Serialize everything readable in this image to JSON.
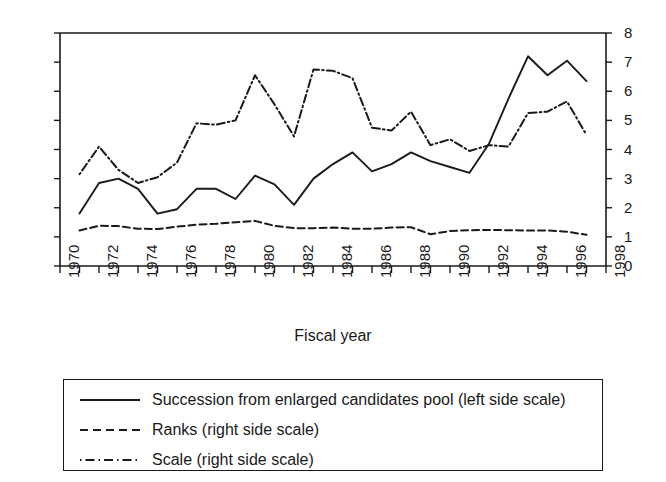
{
  "chart_data": {
    "type": "line",
    "title": "",
    "xlabel": "Fiscal year",
    "ylabel": "",
    "xlim": [
      1970,
      1998
    ],
    "xticks": [
      1970,
      1971,
      1972,
      1973,
      1974,
      1975,
      1976,
      1977,
      1978,
      1979,
      1980,
      1981,
      1982,
      1983,
      1984,
      1985,
      1986,
      1987,
      1988,
      1989,
      1990,
      1991,
      1992,
      1993,
      1994,
      1995,
      1996,
      1997,
      1998
    ],
    "xtick_labels": [
      "1970",
      "1972",
      "1974",
      "1976",
      "1978",
      "1980",
      "1982",
      "1984",
      "1986",
      "1988",
      "1990",
      "1992",
      "1994",
      "1996",
      "1998"
    ],
    "xtick_label_years": [
      1970,
      1972,
      1974,
      1976,
      1978,
      1980,
      1982,
      1984,
      1986,
      1988,
      1990,
      1992,
      1994,
      1996,
      1998
    ],
    "left_axis": {
      "label": "",
      "ylim": [
        0,
        16
      ],
      "ticks": [
        0,
        2,
        4,
        6,
        8,
        10,
        12,
        14,
        16
      ],
      "grid": false
    },
    "right_axis": {
      "label": "",
      "ylim": [
        0,
        8
      ],
      "ticks": [
        0,
        1,
        2,
        3,
        4,
        5,
        6,
        7,
        8
      ],
      "grid": false
    },
    "legend_position": "below-plot",
    "x": [
      1971,
      1972,
      1973,
      1974,
      1975,
      1976,
      1977,
      1978,
      1979,
      1980,
      1981,
      1982,
      1983,
      1984,
      1985,
      1986,
      1987,
      1988,
      1989,
      1990,
      1991,
      1992,
      1993,
      1994,
      1995,
      1996,
      1997
    ],
    "series": [
      {
        "name": "Succession from enlarged candidates pool (left side scale)",
        "axis": "left",
        "style": "solid",
        "color": "#1a1a1a",
        "values": [
          3.6,
          5.7,
          6.0,
          5.3,
          3.6,
          3.9,
          5.3,
          5.3,
          4.6,
          6.2,
          5.6,
          4.2,
          6.0,
          7.0,
          7.8,
          6.5,
          7.0,
          7.8,
          7.2,
          6.8,
          6.4,
          8.4,
          11.5,
          14.4,
          13.1,
          14.1,
          12.7
        ]
      },
      {
        "name": "Ranks (right side scale)",
        "axis": "right",
        "style": "dashed",
        "color": "#1a1a1a",
        "values": [
          1.22,
          1.38,
          1.37,
          1.28,
          1.27,
          1.35,
          1.42,
          1.45,
          1.5,
          1.55,
          1.38,
          1.3,
          1.3,
          1.32,
          1.28,
          1.28,
          1.32,
          1.33,
          1.09,
          1.2,
          1.23,
          1.24,
          1.23,
          1.22,
          1.22,
          1.18,
          1.07
        ]
      },
      {
        "name": "Scale (right side scale)",
        "axis": "right",
        "style": "dashdot",
        "color": "#1a1a1a",
        "values": [
          3.15,
          4.1,
          3.3,
          2.85,
          3.05,
          3.55,
          4.9,
          4.85,
          5.0,
          6.55,
          5.55,
          4.45,
          6.75,
          6.7,
          6.45,
          4.75,
          4.65,
          5.3,
          4.15,
          4.35,
          3.95,
          4.15,
          4.1,
          5.25,
          5.3,
          5.65,
          4.5
        ]
      }
    ]
  },
  "legend": {
    "items": [
      {
        "label": "Succession from enlarged candidates pool (left side scale)",
        "style": "solid"
      },
      {
        "label": "Ranks (right side scale)",
        "style": "dashed"
      },
      {
        "label": "Scale (right side scale)",
        "style": "dashdot"
      }
    ]
  }
}
